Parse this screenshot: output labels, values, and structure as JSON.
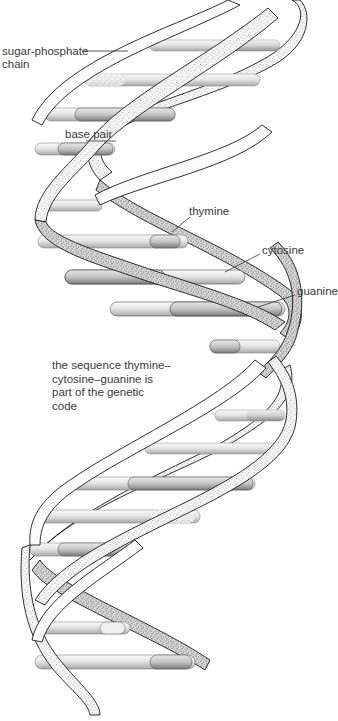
{
  "diagram": {
    "colors": {
      "outline": "#1a1a1a",
      "strand_fill": "#f2f2f2",
      "strand_stipple": "#6b6b6b",
      "base_fill": "#e4e4e4",
      "base_shade": "#9a9a9a",
      "label_text": "#3a3a3a",
      "background": "#ffffff"
    },
    "labels": {
      "sugar_phosphate": [
        "sugar-phosphate",
        "chain"
      ],
      "base_pair": "base pair",
      "thymine": "thymine",
      "cytosine": "cytosine",
      "guanine": "guanine"
    },
    "caption": [
      "the sequence thymine–",
      "cytosine–guanine is",
      "part of the genetic",
      "code"
    ]
  }
}
